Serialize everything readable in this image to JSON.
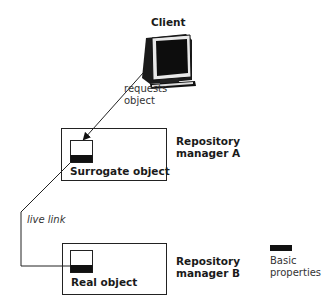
{
  "client": {
    "label": "Client",
    "icon": "computer-monitor-icon"
  },
  "request_arrow": {
    "label_line1": "requests",
    "label_line2": "object"
  },
  "manager_a": {
    "label_line1": "Repository",
    "label_line2": "manager A",
    "object_label": "Surrogate object"
  },
  "live_link": {
    "label": "live link"
  },
  "manager_b": {
    "label_line1": "Repository",
    "label_line2": "manager B",
    "object_label": "Real object"
  },
  "legend": {
    "swatch_color": "#111111",
    "label_line1": "Basic",
    "label_line2": "properties"
  }
}
